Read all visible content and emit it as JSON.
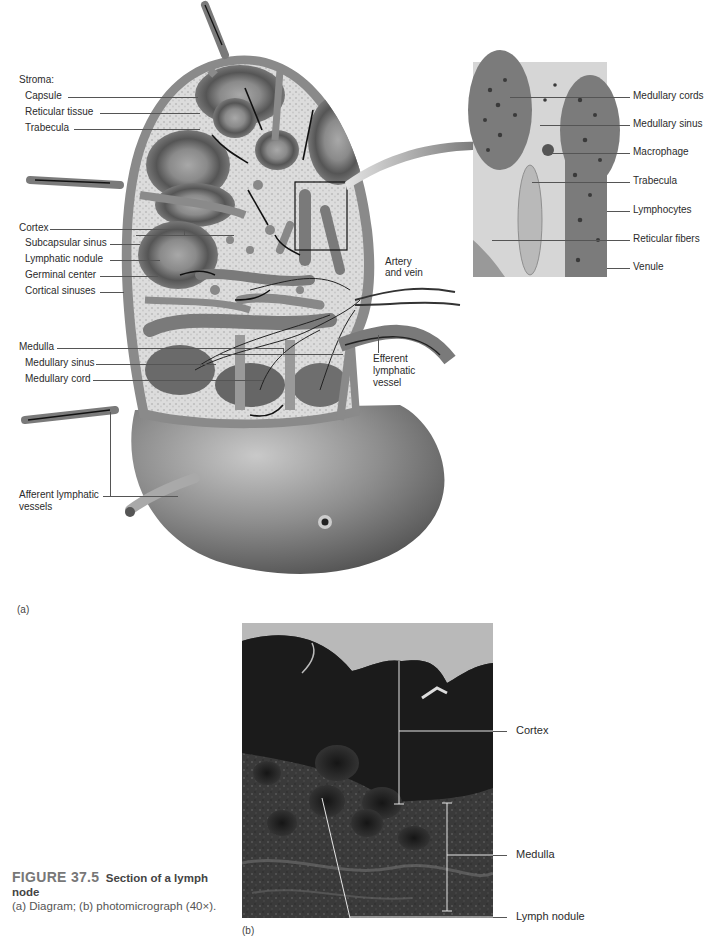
{
  "figure": {
    "number": "FIGURE 37.5",
    "title": "Section of a lymph node",
    "description": "(a) Diagram; (b) photomicrograph (40×).",
    "title_line2": "node",
    "description_line": "(a) Diagram; (b) photomicrograph",
    "description_line3": "(40×)."
  },
  "panel_a": {
    "letter": "(a)",
    "labels_left": {
      "stroma_heading": "Stroma:",
      "capsule": "Capsule",
      "reticular_tissue": "Reticular tissue",
      "trabecula": "Trabecula",
      "cortex": "Cortex",
      "subcapsular_sinus": "Subcapsular sinus",
      "lymphatic_nodule": "Lymphatic nodule",
      "germinal_center": "Germinal center",
      "cortical_sinuses": "Cortical sinuses",
      "medulla": "Medulla",
      "medullary_sinus": "Medullary sinus",
      "medullary_cord": "Medullary cord",
      "afferent_vessels_l1": "Afferent lymphatic",
      "afferent_vessels_l2": "vessels"
    },
    "labels_center": {
      "artery_vein_l1": "Artery",
      "artery_vein_l2": "and vein",
      "efferent_l1": "Efferent",
      "efferent_l2": "lymphatic",
      "efferent_l3": "vessel"
    },
    "inset_labels": [
      "Medullary cords",
      "Medullary sinus",
      "Macrophage",
      "Trabecula",
      "Lymphocytes",
      "Reticular fibers",
      "Venule"
    ]
  },
  "panel_b": {
    "letter": "(b)",
    "labels": [
      "Cortex",
      "Medulla",
      "Lymph node"
    ],
    "label_cortex": "Cortex",
    "label_medulla": "Medulla",
    "label_lymph_nodule": "Lymph nodule"
  },
  "colors": {
    "capsule": "#8a8a8a",
    "reticular": "#d6d6d6",
    "nodule_dark": "#555555",
    "nodule_light": "#9a9a9a",
    "body_shade": "#6e6e6e",
    "photo_dark": "#1e1e1e"
  }
}
